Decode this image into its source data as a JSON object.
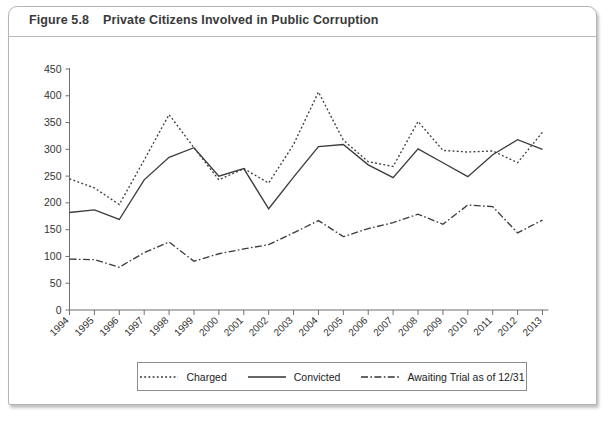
{
  "figure": {
    "number": "Figure 5.8",
    "title": "Private Citizens Involved in Public Corruption"
  },
  "legend": {
    "items": [
      {
        "label": "Charged",
        "style": "dotted"
      },
      {
        "label": "Convicted",
        "style": "solid"
      },
      {
        "label": "Awaiting Trial as of 12/31",
        "style": "dash-dot"
      }
    ]
  },
  "chart_data": {
    "type": "line",
    "title": "Private Citizens Involved in Public Corruption",
    "xlabel": "",
    "ylabel": "",
    "ylim": [
      0,
      450
    ],
    "yticks": [
      0,
      50,
      100,
      150,
      200,
      250,
      300,
      350,
      400,
      450
    ],
    "grid": false,
    "legend_position": "bottom",
    "categories": [
      "1994",
      "1995",
      "1996",
      "1997",
      "1998",
      "1999",
      "2000",
      "2001",
      "2002",
      "2003",
      "2004",
      "2005",
      "2006",
      "2007",
      "2008",
      "2009",
      "2010",
      "2011",
      "2012",
      "2013"
    ],
    "series": [
      {
        "name": "Charged",
        "style": "dotted",
        "color": "#3c3c3c",
        "values": [
          245,
          228,
          197,
          280,
          365,
          303,
          243,
          264,
          237,
          309,
          407,
          317,
          277,
          268,
          352,
          298,
          295,
          297,
          275,
          332
        ]
      },
      {
        "name": "Convicted",
        "style": "solid",
        "color": "#3c3c3c",
        "values": [
          182,
          187,
          169,
          243,
          285,
          303,
          250,
          264,
          189,
          248,
          305,
          309,
          271,
          247,
          301,
          275,
          249,
          290,
          318,
          300
        ]
      },
      {
        "name": "Awaiting Trial as of 12/31",
        "style": "dash-dot",
        "color": "#3c3c3c",
        "values": [
          95,
          94,
          80,
          107,
          127,
          91,
          105,
          114,
          122,
          144,
          167,
          137,
          152,
          163,
          179,
          160,
          196,
          193,
          144,
          168
        ]
      }
    ]
  }
}
